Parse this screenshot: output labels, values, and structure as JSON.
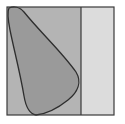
{
  "diagram": {
    "frame": {
      "x": 7,
      "y": 7,
      "width": 107,
      "height": 108,
      "stroke": "#3a3a3a"
    },
    "left_region": {
      "x": 7,
      "y": 7,
      "width": 74,
      "height": 108,
      "fill": "#b4b4b4"
    },
    "right_region": {
      "x": 81,
      "y": 7,
      "width": 33,
      "height": 108,
      "fill": "#dcdcdc"
    },
    "divider": {
      "x": 81,
      "stroke": "#3a3a3a"
    },
    "blob": {
      "fill": "#9a9a9a",
      "stroke": "#2e2e2e",
      "path": "M9,8 C14,6 20,7 24,12 C40,32 62,52 76,72 C82,82 78,92 68,100 C58,108 46,114 36,115 C30,114 26,108 24,96 C20,72 14,50 10,30 C8,20 7,12 9,8 Z"
    }
  }
}
